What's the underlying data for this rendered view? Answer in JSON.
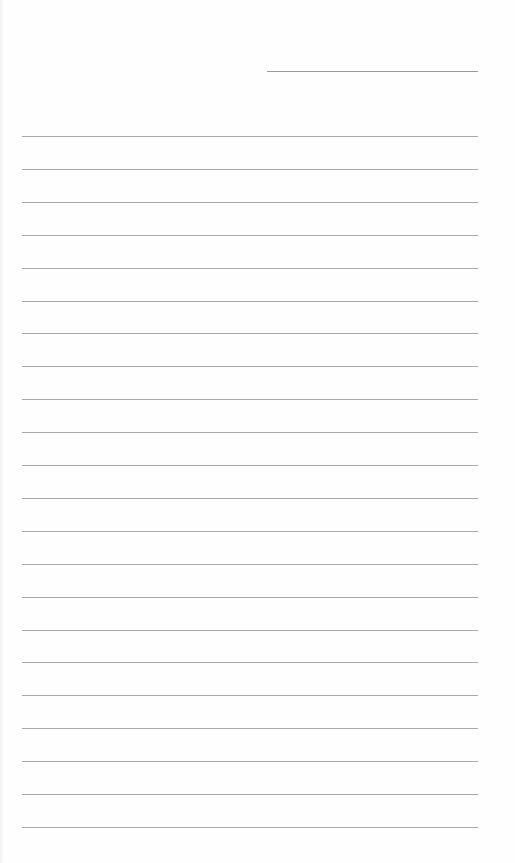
{
  "page": {
    "type": "lined-paper",
    "background": "#fefefe",
    "line_color": "#a8a8a8",
    "date_line": {
      "left": 267,
      "top": 71,
      "width": 211
    },
    "rules": {
      "count": 22,
      "first_top": 136,
      "spacing": 32.9,
      "left": 22,
      "width": 456
    }
  }
}
